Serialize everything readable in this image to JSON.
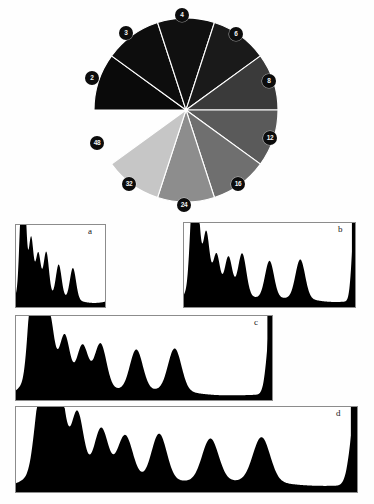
{
  "figure": {
    "caption_letters": [
      "a",
      "b",
      "c",
      "d"
    ]
  },
  "wheel": {
    "name": "grayscale-sector-wheel",
    "center_x": 186,
    "center_y": 110,
    "radius": 92,
    "start_angle_deg": 180,
    "sector_span_deg": 36,
    "sector_count": 10,
    "separator_color": "#ffffff",
    "label_bg_color": "#0c0c0c",
    "label_text_color": "#f2f2f2",
    "sectors": [
      {
        "label": "2",
        "fill": "#0a0a0a",
        "label_x": 92,
        "label_y": 78,
        "visible_wedge": true
      },
      {
        "label": "3",
        "fill": "#0d0d0d",
        "label_x": 126,
        "label_y": 33,
        "visible_wedge": true
      },
      {
        "label": "4",
        "fill": "#101010",
        "label_x": 182,
        "label_y": 15,
        "visible_wedge": true
      },
      {
        "label": "6",
        "fill": "#1a1a1a",
        "label_x": 236,
        "label_y": 34,
        "visible_wedge": true
      },
      {
        "label": "8",
        "fill": "#3a3a3a",
        "label_x": 269,
        "label_y": 81,
        "visible_wedge": true
      },
      {
        "label": "12",
        "fill": "#5a5a5a",
        "label_x": 270,
        "label_y": 138,
        "visible_wedge": true
      },
      {
        "label": "16",
        "fill": "#6f6f6f",
        "label_x": 238,
        "label_y": 184,
        "visible_wedge": true
      },
      {
        "label": "24",
        "fill": "#8d8d8d",
        "label_x": 184,
        "label_y": 205,
        "visible_wedge": true
      },
      {
        "label": "32",
        "fill": "#c6c6c6",
        "label_x": 129,
        "label_y": 184,
        "visible_wedge": true
      },
      {
        "label": "48",
        "fill": "#ffffff",
        "label_x": 97,
        "label_y": 143,
        "visible_wedge": false
      }
    ]
  },
  "chart_data": [
    {
      "type": "line",
      "name": "histogram-a",
      "panel": "a",
      "title": "a",
      "xlabel": "",
      "ylabel": "",
      "xlim": [
        0,
        100
      ],
      "ylim": [
        0,
        100
      ],
      "grid": false,
      "baseline": 4,
      "right_edge_spike": false,
      "peaks": [
        {
          "x": 6,
          "height": 97,
          "width": 2.2
        },
        {
          "x": 10,
          "height": 86,
          "width": 2.0
        },
        {
          "x": 17,
          "height": 62,
          "width": 2.6
        },
        {
          "x": 25,
          "height": 48,
          "width": 2.8
        },
        {
          "x": 34,
          "height": 52,
          "width": 3.0
        },
        {
          "x": 48,
          "height": 40,
          "width": 3.2
        },
        {
          "x": 64,
          "height": 38,
          "width": 3.4
        }
      ]
    },
    {
      "type": "line",
      "name": "histogram-b",
      "panel": "b",
      "title": "b",
      "xlabel": "",
      "ylabel": "",
      "xlim": [
        0,
        100
      ],
      "ylim": [
        0,
        100
      ],
      "grid": false,
      "baseline": 5,
      "right_edge_spike": true,
      "peaks": [
        {
          "x": 5,
          "height": 98,
          "width": 1.6
        },
        {
          "x": 8,
          "height": 82,
          "width": 1.5
        },
        {
          "x": 13,
          "height": 66,
          "width": 1.9
        },
        {
          "x": 19,
          "height": 45,
          "width": 2.0
        },
        {
          "x": 26,
          "height": 44,
          "width": 2.2
        },
        {
          "x": 34,
          "height": 50,
          "width": 2.4
        },
        {
          "x": 50,
          "height": 44,
          "width": 2.6
        },
        {
          "x": 68,
          "height": 46,
          "width": 2.8
        }
      ]
    },
    {
      "type": "line",
      "name": "histogram-c",
      "panel": "c",
      "title": "c",
      "xlabel": "",
      "ylabel": "",
      "xlim": [
        0,
        100
      ],
      "ylim": [
        0,
        100
      ],
      "grid": false,
      "baseline": 5,
      "right_edge_spike": true,
      "peaks": [
        {
          "x": 6,
          "height": 92,
          "width": 1.5
        },
        {
          "x": 9,
          "height": 99,
          "width": 1.5
        },
        {
          "x": 13,
          "height": 74,
          "width": 1.8
        },
        {
          "x": 19,
          "height": 57,
          "width": 2.0
        },
        {
          "x": 26,
          "height": 48,
          "width": 2.2
        },
        {
          "x": 33,
          "height": 52,
          "width": 2.3
        },
        {
          "x": 47,
          "height": 48,
          "width": 2.5
        },
        {
          "x": 62,
          "height": 50,
          "width": 2.6
        }
      ]
    },
    {
      "type": "line",
      "name": "histogram-d",
      "panel": "d",
      "title": "d",
      "xlabel": "",
      "ylabel": "",
      "xlim": [
        0,
        100
      ],
      "ylim": [
        0,
        100
      ],
      "grid": false,
      "baseline": 6,
      "right_edge_spike": true,
      "peaks": [
        {
          "x": 7,
          "height": 84,
          "width": 1.6
        },
        {
          "x": 10,
          "height": 97,
          "width": 1.4
        },
        {
          "x": 13,
          "height": 83,
          "width": 1.5
        },
        {
          "x": 18,
          "height": 70,
          "width": 1.8
        },
        {
          "x": 25,
          "height": 56,
          "width": 2.0
        },
        {
          "x": 32,
          "height": 50,
          "width": 2.2
        },
        {
          "x": 42,
          "height": 54,
          "width": 2.2
        },
        {
          "x": 57,
          "height": 50,
          "width": 2.4
        },
        {
          "x": 72,
          "height": 52,
          "width": 2.5
        }
      ]
    }
  ]
}
